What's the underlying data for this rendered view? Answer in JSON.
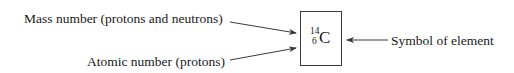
{
  "diagram": {
    "labels": {
      "mass_number": "Mass number (protons and neutrons)",
      "atomic_number": "Atomic number (protons)",
      "symbol_of_element": "Symbol of element"
    },
    "notation": {
      "mass_number": "14",
      "atomic_number": "6",
      "symbol": "C"
    },
    "colors": {
      "text": "#1a1a1a",
      "lines": "#3a3a3a",
      "background": "#ffffff"
    }
  }
}
